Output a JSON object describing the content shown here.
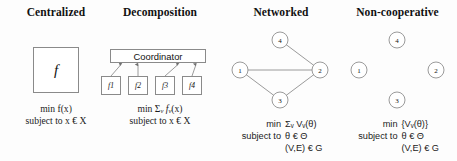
{
  "figure": {
    "background_color": "#fdfdfd",
    "stroke_color": "#8a8a8a",
    "text_color": "#111111"
  },
  "panels": [
    {
      "id": "centralized",
      "title": "Centralized",
      "box_label": "f",
      "formula_line1": "min f(x)",
      "formula_line2": "subject to x € X"
    },
    {
      "id": "decomposition",
      "title": "Decomposition",
      "coordinator_label": "Coordinator",
      "subproblems": [
        "f1",
        "f2",
        "f3",
        "f4"
      ],
      "formula_min": "min",
      "formula_sum": "Σ",
      "formula_sum_sub": "v",
      "formula_fn": "f",
      "formula_fn_sub": "v",
      "formula_arg": "(x)",
      "formula_line2": "subject to x € X"
    },
    {
      "id": "networked",
      "title": "Networked",
      "nodes": [
        {
          "label": "4",
          "cx": 58,
          "cy": 40
        },
        {
          "label": "1",
          "cx": 18,
          "cy": 70
        },
        {
          "label": "2",
          "cx": 98,
          "cy": 70
        },
        {
          "label": "3",
          "cx": 58,
          "cy": 100
        }
      ],
      "edges": [
        [
          0,
          2
        ],
        [
          1,
          2
        ],
        [
          1,
          3
        ],
        [
          2,
          3
        ]
      ],
      "formula_min_label": "min",
      "formula_min_value": "Σᵥ Vᵥ(θ)",
      "formula_subject_label": "subject to",
      "formula_subject_value": "θ € Θ",
      "formula_constraint_value": "(V,E) € G"
    },
    {
      "id": "noncooperative",
      "title": "Non-cooperative",
      "nodes": [
        {
          "label": "4",
          "cx": 59,
          "cy": 40
        },
        {
          "label": "1",
          "cx": 21,
          "cy": 70
        },
        {
          "label": "2",
          "cx": 98,
          "cy": 70
        },
        {
          "label": "3",
          "cx": 59,
          "cy": 100
        }
      ],
      "edges": [],
      "formula_min_label": "min",
      "formula_min_value": "{Vᵥ(θ)}",
      "formula_subject_label": "subject to",
      "formula_subject_value": "θ € Θ",
      "formula_constraint_value": "(V,E) € G"
    }
  ]
}
